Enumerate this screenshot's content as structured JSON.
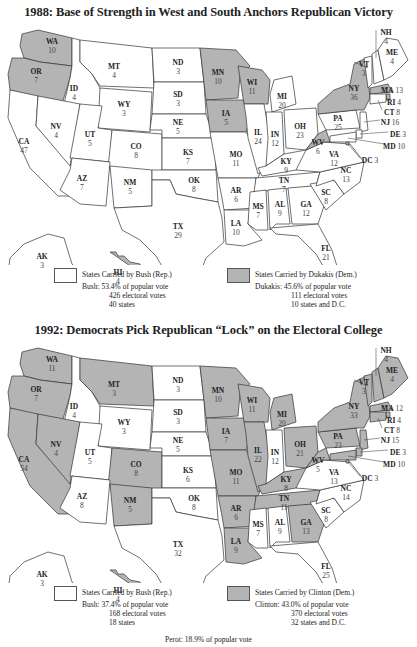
{
  "colors": {
    "republican": "#ffffff",
    "democrat": "#b4b4b4",
    "stroke": "#333333"
  },
  "maps": [
    {
      "title": "1988: Base of Strength in West and South Anchors Republican Victory",
      "states": {
        "WA": {
          "ev": "10",
          "party": "D"
        },
        "OR": {
          "ev": "7",
          "party": "D"
        },
        "CA": {
          "ev": "47",
          "party": "R"
        },
        "ID": {
          "ev": "4",
          "party": "R"
        },
        "NV": {
          "ev": "4",
          "party": "R"
        },
        "MT": {
          "ev": "4",
          "party": "R"
        },
        "WY": {
          "ev": "3",
          "party": "R"
        },
        "UT": {
          "ev": "5",
          "party": "R"
        },
        "AZ": {
          "ev": "7",
          "party": "R"
        },
        "CO": {
          "ev": "8",
          "party": "R"
        },
        "NM": {
          "ev": "5",
          "party": "R"
        },
        "ND": {
          "ev": "3",
          "party": "R"
        },
        "SD": {
          "ev": "3",
          "party": "R"
        },
        "NE": {
          "ev": "5",
          "party": "R"
        },
        "KS": {
          "ev": "7",
          "party": "R"
        },
        "OK": {
          "ev": "8",
          "party": "R"
        },
        "TX": {
          "ev": "29",
          "party": "R"
        },
        "MN": {
          "ev": "10",
          "party": "D"
        },
        "IA": {
          "ev": "5",
          "party": "D"
        },
        "MO": {
          "ev": "11",
          "party": "R"
        },
        "AR": {
          "ev": "6",
          "party": "R"
        },
        "LA": {
          "ev": "10",
          "party": "R"
        },
        "WI": {
          "ev": "11",
          "party": "D"
        },
        "IL": {
          "ev": "24",
          "party": "R"
        },
        "MI": {
          "ev": "20",
          "party": "R"
        },
        "IN": {
          "ev": "12",
          "party": "R"
        },
        "OH": {
          "ev": "23",
          "party": "R"
        },
        "KY": {
          "ev": "9",
          "party": "R"
        },
        "TN": {
          "ev": "7",
          "party": "R"
        },
        "MS": {
          "ev": "7",
          "party": "R"
        },
        "AL": {
          "ev": "9",
          "party": "R"
        },
        "GA": {
          "ev": "12",
          "party": "R"
        },
        "FL": {
          "ev": "21",
          "party": "R"
        },
        "SC": {
          "ev": "8",
          "party": "R"
        },
        "NC": {
          "ev": "13",
          "party": "R"
        },
        "VA": {
          "ev": "12",
          "party": "R"
        },
        "WV": {
          "ev": "6",
          "party": "D"
        },
        "PA": {
          "ev": "25",
          "party": "R"
        },
        "NY": {
          "ev": "36",
          "party": "D"
        },
        "VT": {
          "ev": "3",
          "party": "R"
        },
        "NH": {
          "ev": "4",
          "party": "R"
        },
        "ME": {
          "ev": "4",
          "party": "R"
        },
        "MA": {
          "ev": "13",
          "party": "D"
        },
        "RI": {
          "ev": "4",
          "party": "D"
        },
        "CT": {
          "ev": "8",
          "party": "R"
        },
        "NJ": {
          "ev": "16",
          "party": "R"
        },
        "DE": {
          "ev": "3",
          "party": "R"
        },
        "MD": {
          "ev": "10",
          "party": "R"
        },
        "DC": {
          "ev": "3",
          "party": "D"
        },
        "AK": {
          "ev": "3",
          "party": "R"
        },
        "HI": {
          "ev": "4",
          "party": "D"
        }
      },
      "legend": {
        "rep_caption": "States Carried by Bush (Rep.)",
        "rep_line1": "Bush: 53.4% of popular vote",
        "rep_line2": "426 electoral votes",
        "rep_line3": "40 states",
        "dem_caption": "States Carried by Dukakis (Dem.)",
        "dem_line1": "Dukakis: 45.6% of popular vote",
        "dem_line2": "111 electoral votes",
        "dem_line3": "10 states and D.C."
      }
    },
    {
      "title": "1992: Democrats Pick Republican “Lock” on the Electoral College",
      "states": {
        "WA": {
          "ev": "11",
          "party": "D"
        },
        "OR": {
          "ev": "7",
          "party": "D"
        },
        "CA": {
          "ev": "54",
          "party": "D"
        },
        "ID": {
          "ev": "4",
          "party": "R"
        },
        "NV": {
          "ev": "4",
          "party": "D"
        },
        "MT": {
          "ev": "3",
          "party": "D"
        },
        "WY": {
          "ev": "3",
          "party": "R"
        },
        "UT": {
          "ev": "5",
          "party": "R"
        },
        "AZ": {
          "ev": "8",
          "party": "R"
        },
        "CO": {
          "ev": "8",
          "party": "D"
        },
        "NM": {
          "ev": "5",
          "party": "D"
        },
        "ND": {
          "ev": "3",
          "party": "R"
        },
        "SD": {
          "ev": "3",
          "party": "R"
        },
        "NE": {
          "ev": "5",
          "party": "R"
        },
        "KS": {
          "ev": "6",
          "party": "R"
        },
        "OK": {
          "ev": "8",
          "party": "R"
        },
        "TX": {
          "ev": "32",
          "party": "R"
        },
        "MN": {
          "ev": "10",
          "party": "D"
        },
        "IA": {
          "ev": "7",
          "party": "D"
        },
        "MO": {
          "ev": "11",
          "party": "D"
        },
        "AR": {
          "ev": "6",
          "party": "D"
        },
        "LA": {
          "ev": "9",
          "party": "D"
        },
        "WI": {
          "ev": "11",
          "party": "D"
        },
        "IL": {
          "ev": "22",
          "party": "D"
        },
        "MI": {
          "ev": "20",
          "party": "D"
        },
        "IN": {
          "ev": "12",
          "party": "R"
        },
        "OH": {
          "ev": "21",
          "party": "D"
        },
        "KY": {
          "ev": "8",
          "party": "D"
        },
        "TN": {
          "ev": "11",
          "party": "D"
        },
        "MS": {
          "ev": "7",
          "party": "R"
        },
        "AL": {
          "ev": "9",
          "party": "R"
        },
        "GA": {
          "ev": "13",
          "party": "D"
        },
        "FL": {
          "ev": "25",
          "party": "R"
        },
        "SC": {
          "ev": "8",
          "party": "R"
        },
        "NC": {
          "ev": "14",
          "party": "R"
        },
        "VA": {
          "ev": "13",
          "party": "R"
        },
        "WV": {
          "ev": "5",
          "party": "D"
        },
        "PA": {
          "ev": "23",
          "party": "D"
        },
        "NY": {
          "ev": "33",
          "party": "D"
        },
        "VT": {
          "ev": "3",
          "party": "D"
        },
        "NH": {
          "ev": "4",
          "party": "D"
        },
        "ME": {
          "ev": "4",
          "party": "D"
        },
        "MA": {
          "ev": "12",
          "party": "D"
        },
        "RI": {
          "ev": "4",
          "party": "D"
        },
        "CT": {
          "ev": "8",
          "party": "D"
        },
        "NJ": {
          "ev": "15",
          "party": "D"
        },
        "DE": {
          "ev": "3",
          "party": "D"
        },
        "MD": {
          "ev": "10",
          "party": "D"
        },
        "DC": {
          "ev": "3",
          "party": "D"
        },
        "AK": {
          "ev": "3",
          "party": "R"
        },
        "HI": {
          "ev": "4",
          "party": "D"
        }
      },
      "legend": {
        "rep_caption": "States Carried by Bush (Rep.)",
        "rep_line1": "Bush: 37.4% of popular vote",
        "rep_line2": "168 electoral votes",
        "rep_line3": "18 states",
        "dem_caption": "States Carried by Clinton (Dem.)",
        "dem_line1": "Clinton: 43.0% of popular vote",
        "dem_line2": "370 electoral votes",
        "dem_line3": "32 states and D.C."
      },
      "footnote": "Perot: 18.9% of popular vote"
    }
  ]
}
